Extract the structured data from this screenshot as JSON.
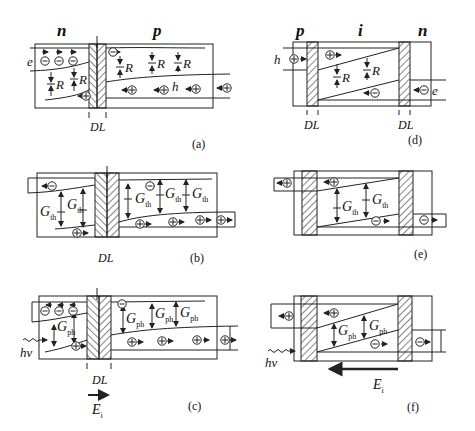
{
  "figure": {
    "panels": [
      {
        "id": "a",
        "caption": "(a)",
        "regions": [
          "n",
          "p"
        ],
        "process": "recombination",
        "rate_symbol": "R",
        "carrier_labels": [
          "e",
          "h"
        ],
        "junction_label": "DL"
      },
      {
        "id": "b",
        "caption": "(b)",
        "regions": [
          "n",
          "p"
        ],
        "process": "thermal generation",
        "rate_symbol": "G",
        "rate_subscript": "th",
        "junction_label": "DL"
      },
      {
        "id": "c",
        "caption": "(c)",
        "regions": [
          "n",
          "p"
        ],
        "process": "photogeneration",
        "rate_symbol": "G",
        "rate_subscript": "ph",
        "photon_label": "hν",
        "field_label": "E",
        "field_subscript": "i",
        "field_direction": "right",
        "junction_label": "DL"
      },
      {
        "id": "d",
        "caption": "(d)",
        "regions": [
          "p",
          "i",
          "n"
        ],
        "process": "recombination",
        "rate_symbol": "R",
        "carrier_labels": [
          "h",
          "e"
        ],
        "junction_labels": [
          "DL",
          "DL"
        ]
      },
      {
        "id": "e",
        "caption": "(e)",
        "regions": [
          "p",
          "i",
          "n"
        ],
        "process": "thermal generation",
        "rate_symbol": "G",
        "rate_subscript": "th"
      },
      {
        "id": "f",
        "caption": "(f)",
        "regions": [
          "p",
          "i",
          "n"
        ],
        "process": "photogeneration",
        "rate_symbol": "G",
        "rate_subscript": "ph",
        "photon_label": "hν",
        "field_label": "E",
        "field_subscript": "i",
        "field_direction": "left"
      }
    ]
  },
  "labels": {
    "a_n": "n",
    "a_p": "p",
    "a_e": "e",
    "a_h": "h",
    "a_dl": "DL",
    "a_cap": "(a)",
    "R": "R",
    "b_dl": "DL",
    "b_cap": "(b)",
    "G": "G",
    "th": "th",
    "c_dl": "DL",
    "c_cap": "(c)",
    "ph": "ph",
    "hv": "hν",
    "E": "E",
    "i_sub": "i",
    "d_p": "p",
    "d_i": "i",
    "d_n": "n",
    "d_h": "h",
    "d_e": "e",
    "d_dl1": "DL",
    "d_dl2": "DL",
    "d_cap": "(d)",
    "e_cap": "(e)",
    "f_cap": "(f)"
  },
  "colors": {
    "line": "#222222",
    "background": "#ffffff"
  }
}
